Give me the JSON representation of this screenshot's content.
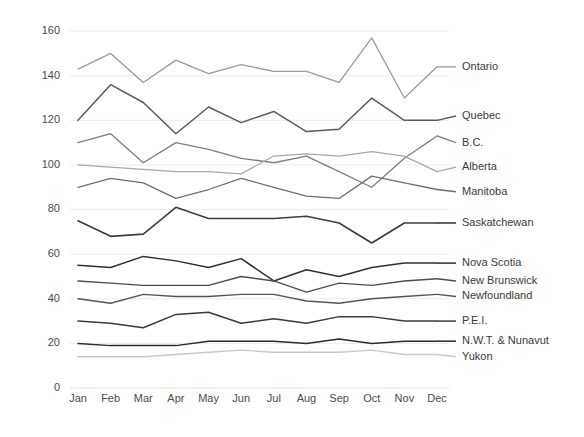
{
  "chart_data": {
    "type": "line",
    "title": "",
    "subtitle": "",
    "xlabel": "",
    "ylabel": "",
    "categories": [
      "Jan",
      "Feb",
      "Mar",
      "Apr",
      "May",
      "Jun",
      "Jul",
      "Aug",
      "Sep",
      "Oct",
      "Nov",
      "Dec"
    ],
    "ylim": [
      0,
      165
    ],
    "yticks": [
      0,
      20,
      40,
      60,
      80,
      100,
      120,
      140,
      160
    ],
    "ytick_labels": [
      "0",
      "20",
      "40",
      "60",
      "80",
      "100",
      "120",
      "140",
      "160"
    ],
    "grid": true,
    "grid_axis": "y",
    "legend_position": "right-inline-labels",
    "series": [
      {
        "name": "Ontario",
        "color": "#9a9a9a",
        "width": 1.3,
        "label_y": 144,
        "values": [
          143,
          150,
          137,
          147,
          141,
          145,
          142,
          142,
          137,
          157,
          130,
          144
        ]
      },
      {
        "name": "Quebec",
        "color": "#5a5a5a",
        "width": 1.5,
        "label_y": 122,
        "values": [
          120,
          136,
          128,
          114,
          126,
          119,
          124,
          115,
          116,
          130,
          120,
          120
        ]
      },
      {
        "name": "B.C.",
        "color": "#7d7d7d",
        "width": 1.3,
        "label_y": 110,
        "values": [
          110,
          114,
          101,
          110,
          107,
          103,
          101,
          104,
          97,
          90,
          103,
          113
        ]
      },
      {
        "name": "Alberta",
        "color": "#a8a8a8",
        "width": 1.3,
        "label_y": 99,
        "values": [
          100,
          99,
          98,
          97,
          97,
          96,
          104,
          105,
          104,
          106,
          104,
          97
        ]
      },
      {
        "name": "Manitoba",
        "color": "#6e6e6e",
        "width": 1.3,
        "label_y": 88,
        "values": [
          90,
          94,
          92,
          85,
          89,
          94,
          90,
          86,
          85,
          95,
          92,
          89
        ]
      },
      {
        "name": "Saskatchewan",
        "color": "#3c3c3c",
        "width": 1.6,
        "label_y": 74,
        "values": [
          75,
          68,
          69,
          81,
          76,
          76,
          76,
          77,
          74,
          65,
          74,
          74
        ]
      },
      {
        "name": "Nova Scotia",
        "color": "#2f2f2f",
        "width": 1.5,
        "label_y": 56,
        "values": [
          55,
          54,
          59,
          57,
          54,
          58,
          48,
          53,
          50,
          54,
          56,
          56
        ]
      },
      {
        "name": "New Brunswick",
        "color": "#4d4d4d",
        "width": 1.4,
        "label_y": 48,
        "values": [
          48,
          47,
          46,
          46,
          46,
          50,
          48,
          43,
          47,
          46,
          48,
          49
        ]
      },
      {
        "name": "Newfoundland",
        "color": "#555555",
        "width": 1.4,
        "label_y": 41,
        "values": [
          40,
          38,
          42,
          41,
          41,
          42,
          42,
          39,
          38,
          40,
          41,
          42
        ]
      },
      {
        "name": "P.E.I.",
        "color": "#3a3a3a",
        "width": 1.5,
        "label_y": 30,
        "values": [
          30,
          29,
          27,
          33,
          34,
          29,
          31,
          29,
          32,
          32,
          30,
          30
        ]
      },
      {
        "name": "N.W.T. & Nunavut",
        "color": "#2b2b2b",
        "width": 1.5,
        "label_y": 21,
        "values": [
          20,
          19,
          19,
          19,
          21,
          21,
          21,
          20,
          22,
          20,
          21,
          21
        ]
      },
      {
        "name": "Yukon",
        "color": "#c9c9c9",
        "width": 1.4,
        "label_y": 14,
        "values": [
          14,
          14,
          14,
          15,
          16,
          17,
          16,
          16,
          16,
          17,
          15,
          15
        ]
      }
    ]
  },
  "geometry": {
    "plot_left": 78,
    "plot_right": 437,
    "plot_top": 20,
    "plot_bottom": 388,
    "label_x": 462,
    "y_value_top": 165,
    "y_value_bottom": 0,
    "xtick_y": 402
  }
}
